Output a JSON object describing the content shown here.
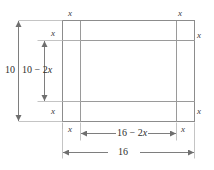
{
  "figure": {
    "colors": {
      "line": "#8c8c8c",
      "text": "#2e2e2e",
      "background": "#ffffff"
    },
    "sheet": {
      "width_label": "16",
      "height_label": "10"
    },
    "cut_squares": {
      "side_label": "x",
      "corner_labels": [
        "x",
        "x",
        "x",
        "x",
        "x",
        "x",
        "x",
        "x"
      ]
    },
    "dimensions": {
      "outer_height": "10",
      "inner_height": "10 − 2x",
      "inner_height_base": "10 − 2",
      "inner_height_var": "x",
      "inner_width": "16 − 2x",
      "inner_width_base": "16 − 2",
      "inner_width_var": "x",
      "outer_width": "16"
    },
    "labels": {
      "top_left_x": "x",
      "top_right_x": "x",
      "upper_left_inner_x": "x",
      "upper_right_inner_x": "x",
      "lower_left_inner_x": "x",
      "lower_right_inner_x": "x",
      "bottom_left_x": "x",
      "bottom_right_x": "x"
    }
  }
}
